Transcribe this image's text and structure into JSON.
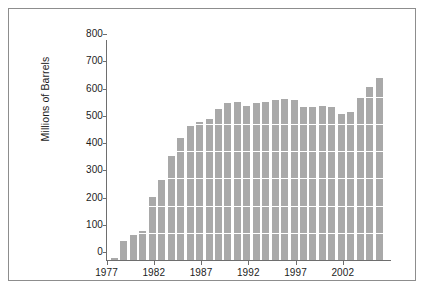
{
  "chart_data": {
    "type": "bar",
    "title": "",
    "xlabel": "",
    "ylabel": "Millions of Barrels",
    "ylim": [
      0,
      800
    ],
    "ytick_values": [
      0,
      100,
      200,
      300,
      400,
      500,
      600,
      700,
      800
    ],
    "ytick_labels": [
      "0",
      "100",
      "200",
      "300",
      "400",
      "500",
      "600",
      "700",
      "800"
    ],
    "xtick_values": [
      1977,
      1982,
      1987,
      1992,
      1997,
      2002
    ],
    "xtick_labels": [
      "1977",
      "1982",
      "1987",
      "1992",
      "1997",
      "2002"
    ],
    "grid": "horizontal-white-gridlines",
    "legend": "none",
    "bar_color": "#a9a9a9",
    "categories": [
      "1977",
      "1978",
      "1979",
      "1980",
      "1981",
      "1982",
      "1983",
      "1984",
      "1985",
      "1986",
      "1987",
      "1988",
      "1989",
      "1990",
      "1991",
      "1992",
      "1993",
      "1994",
      "1995",
      "1996",
      "1997",
      "1998",
      "1999",
      "2000",
      "2001",
      "2002",
      "2003",
      "2004",
      "2005"
    ],
    "values": [
      7,
      68,
      92,
      105,
      231,
      295,
      380,
      448,
      492,
      505,
      517,
      555,
      577,
      581,
      566,
      575,
      581,
      586,
      590,
      588,
      561,
      560,
      564,
      562,
      537,
      545,
      595,
      635,
      668
    ]
  },
  "figure": {
    "frame_color": "#8d8d8d",
    "background": "#ffffff",
    "axis_color": "#6e6e6e"
  }
}
